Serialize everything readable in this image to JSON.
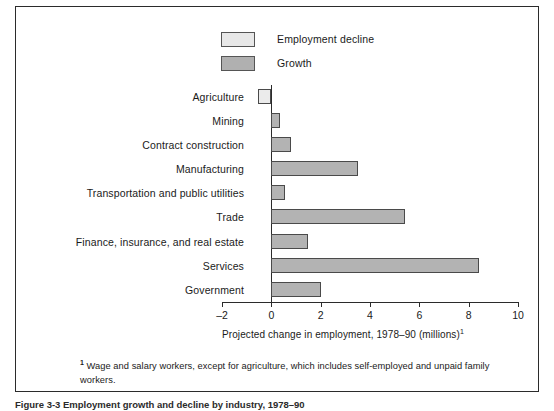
{
  "figure": {
    "caption_partial": "Figure 3-3 Employment growth and decline by industry, 1978–90"
  },
  "legend": {
    "items": [
      {
        "label": "Employment decline",
        "swatch": "light-gray-swatch",
        "color": "#e8e8e8"
      },
      {
        "label": "Growth",
        "swatch": "dark-gray-swatch",
        "color": "#b0b0b0"
      }
    ]
  },
  "axis": {
    "title": "Projected change in employment, 1978–90 (millions)",
    "title_footnote_marker": "1",
    "ticks": [
      "–2",
      "0",
      "2",
      "4",
      "6",
      "8",
      "10"
    ],
    "tick_values": [
      -2,
      0,
      2,
      4,
      6,
      8,
      10
    ],
    "min": -2,
    "max": 10
  },
  "footnote": {
    "marker": "1",
    "text": "Wage and salary workers, except for agriculture, which includes self-employed and  unpaid family workers."
  },
  "chart_data": {
    "type": "bar",
    "orientation": "horizontal",
    "title": "",
    "subtitle": "",
    "xlabel": "Projected change in employment, 1978–90 (millions)",
    "ylabel": "",
    "xlim": [
      -2,
      10
    ],
    "grid": false,
    "legend_position": "top-center",
    "categories": [
      "Agriculture",
      "Mining",
      "Contract construction",
      "Manufacturing",
      "Transportation and public utilities",
      "Trade",
      "Finance, insurance, and real estate",
      "Services",
      "Government"
    ],
    "values": [
      -0.55,
      0.35,
      0.8,
      3.5,
      0.55,
      5.4,
      1.5,
      8.4,
      2.0
    ],
    "series": [
      {
        "name": "Employment decline",
        "values": [
          -0.55,
          null,
          null,
          null,
          null,
          null,
          null,
          null,
          null
        ]
      },
      {
        "name": "Growth",
        "values": [
          null,
          0.35,
          0.8,
          3.5,
          0.55,
          5.4,
          1.5,
          8.4,
          2.0
        ]
      }
    ],
    "bars": [
      {
        "category": "Agriculture",
        "value": -0.55,
        "series": "Employment decline"
      },
      {
        "category": "Mining",
        "value": 0.35,
        "series": "Growth"
      },
      {
        "category": "Contract construction",
        "value": 0.8,
        "series": "Growth"
      },
      {
        "category": "Manufacturing",
        "value": 3.5,
        "series": "Growth"
      },
      {
        "category": "Transportation and public utilities",
        "value": 0.55,
        "series": "Growth"
      },
      {
        "category": "Trade",
        "value": 5.4,
        "series": "Growth"
      },
      {
        "category": "Finance, insurance, and real estate",
        "value": 1.5,
        "series": "Growth"
      },
      {
        "category": "Services",
        "value": 8.4,
        "series": "Growth"
      },
      {
        "category": "Government",
        "value": 2.0,
        "series": "Growth"
      }
    ]
  }
}
